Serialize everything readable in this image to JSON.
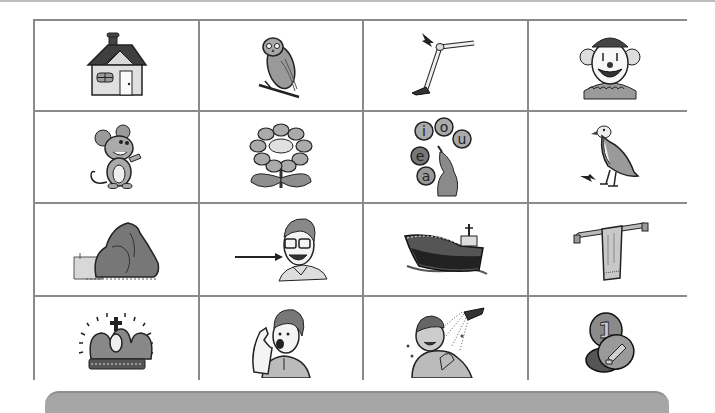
{
  "worksheet": {
    "grid": {
      "rows": 4,
      "columns": 4,
      "line_color": "#8a8a8a",
      "cells": [
        {
          "row": 1,
          "col": 1,
          "picture": "house"
        },
        {
          "row": 1,
          "col": 2,
          "picture": "owl"
        },
        {
          "row": 1,
          "col": 3,
          "picture": "leg-with-arrow-at-knee"
        },
        {
          "row": 1,
          "col": 4,
          "picture": "clown"
        },
        {
          "row": 2,
          "col": 1,
          "picture": "mouse"
        },
        {
          "row": 2,
          "col": 2,
          "picture": "flower"
        },
        {
          "row": 2,
          "col": 3,
          "picture": "vowel-balls-seal"
        },
        {
          "row": 2,
          "col": 4,
          "picture": "bird-with-arrow-at-foot"
        },
        {
          "row": 3,
          "col": 1,
          "picture": "rock"
        },
        {
          "row": 3,
          "col": 2,
          "picture": "man-with-arrow-at-cheek"
        },
        {
          "row": 3,
          "col": 3,
          "picture": "ship"
        },
        {
          "row": 3,
          "col": 4,
          "picture": "towel"
        },
        {
          "row": 4,
          "col": 1,
          "picture": "crown"
        },
        {
          "row": 4,
          "col": 2,
          "picture": "boy-shouting"
        },
        {
          "row": 4,
          "col": 3,
          "picture": "boy-showering"
        },
        {
          "row": 4,
          "col": 4,
          "picture": "coins"
        }
      ]
    },
    "vowel_letters": [
      "i",
      "o",
      "u",
      "e",
      "a"
    ],
    "coin_numeral": "1",
    "bottom_bar_color": "#a6a6a6"
  }
}
